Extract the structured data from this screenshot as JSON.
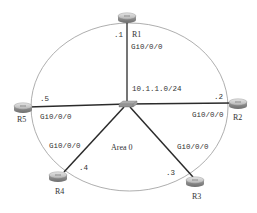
{
  "diagram": {
    "network": "10.1.1.0/24",
    "area": "Area 0",
    "switch": {
      "name": "switch"
    },
    "routers": [
      {
        "name": "R1",
        "interface": "Gi0/0/0",
        "host": ".1"
      },
      {
        "name": "R2",
        "interface": "Gi0/0/0",
        "host": ".2"
      },
      {
        "name": "R3",
        "interface": "Gi0/0/0",
        "host": ".3"
      },
      {
        "name": "R4",
        "interface": "Gi0/0/0",
        "host": ".4"
      },
      {
        "name": "R5",
        "interface": "Gi0/0/0",
        "host": ".5"
      }
    ],
    "colors": {
      "ellipse": "#999999",
      "link": "#2b2b2b",
      "router_body": "#a9a9a9",
      "switch_body": "#8a8a8a"
    }
  }
}
